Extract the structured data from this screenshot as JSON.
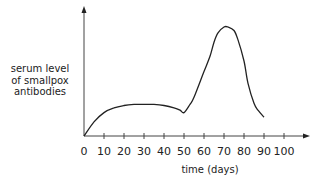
{
  "chart_data": {
    "type": "line",
    "title": "",
    "xlabel": "time (days)",
    "ylabel": "serum level of smallpox antibodies",
    "ylabel_lines": [
      "serum level",
      "of smallpox",
      "antibodies"
    ],
    "x_ticks": [
      0,
      10,
      20,
      30,
      40,
      50,
      60,
      70,
      80,
      90,
      100
    ],
    "xlim": [
      0,
      100
    ],
    "y_ticks": [],
    "grid": false,
    "legend": null,
    "series": [
      {
        "name": "serum antibody level (relative, 0-100)",
        "x": [
          0,
          5,
          10,
          15,
          20,
          25,
          30,
          35,
          40,
          45,
          48,
          50,
          53,
          55,
          60,
          63,
          65,
          67,
          70,
          72,
          75,
          77,
          80,
          82,
          85,
          87,
          90
        ],
        "y": [
          0,
          12,
          20,
          24,
          26,
          27,
          27,
          27,
          26,
          24,
          22,
          20,
          27,
          33,
          55,
          68,
          80,
          88,
          93,
          93,
          90,
          82,
          64,
          45,
          28,
          22,
          16
        ]
      }
    ],
    "annotations": []
  }
}
